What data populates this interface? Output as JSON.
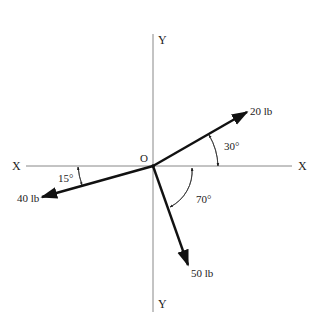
{
  "diagram": {
    "origin_label": "O",
    "axes": {
      "x_left_label": "X",
      "x_right_label": "X",
      "y_top_label": "Y",
      "y_bottom_label": "Y"
    },
    "forces": [
      {
        "magnitude_label": "20 lb",
        "angle_label": "30°",
        "angle_reference": "+X axis, above",
        "direction_deg": 30
      },
      {
        "magnitude_label": "40 lb",
        "angle_label": "15°",
        "angle_reference": "-X axis, below",
        "direction_deg": 195
      },
      {
        "magnitude_label": "50 lb",
        "angle_label": "70°",
        "angle_reference": "+X axis, below",
        "direction_deg": -70
      }
    ],
    "colors": {
      "axis": "#888888",
      "vector": "#111111",
      "text": "#222222"
    }
  }
}
